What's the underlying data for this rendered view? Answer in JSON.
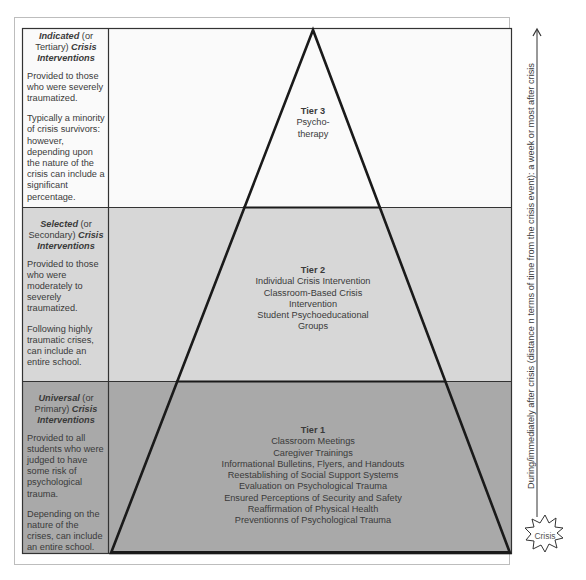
{
  "diagram": {
    "type": "tiered-pyramid",
    "colors": {
      "tier3_bg": "#fafafa",
      "tier2_bg": "#d7d7d7",
      "tier1_bg": "#a9a9a9",
      "line": "#1a1a1a"
    },
    "left_column": {
      "tier3": {
        "heading_bold": "Indicated",
        "heading_rest1": " (or Tertiary) ",
        "heading_bold2": "Crisis Interventions",
        "para1": "Provided to those who were severely traumatized.",
        "para2": "Typically a minority of crisis survivors: however, depending upon the nature of the crisis can include a significant percentage."
      },
      "tier2": {
        "heading_bold": "Selected",
        "heading_rest1": " (or Secondary) ",
        "heading_bold2": "Crisis Interventions",
        "para1": "Provided to those who were moderately to severely traumatized.",
        "para2": "Following highly traumatic crises, can include an entire school."
      },
      "tier1": {
        "heading_bold": "Universal",
        "heading_rest1": " (or Primary) ",
        "heading_bold2": "Crisis Interventions",
        "para1": "Provided to all students who were judged to have some risk of psychological trauma.",
        "para2": "Depending on the nature of the crises, can include an entire school."
      }
    },
    "pyramid": {
      "tier3": {
        "title": "Tier 3",
        "items": [
          "Psycho-",
          "therapy"
        ]
      },
      "tier2": {
        "title": "Tier 2",
        "items": [
          "Individual Crisis Intervention",
          "Classroom-Based Crisis",
          "Intervention",
          "Student Psychoeducational",
          "Groups"
        ]
      },
      "tier1": {
        "title": "Tier 1",
        "items": [
          "Classroom Meetings",
          "Caregiver Trainings",
          "Informational Bulletins, Flyers, and Handouts",
          "Reestablishing of Social Support Systems",
          "Evaluation on Psychological Trauma",
          "Ensured Perceptions of Security and Safety",
          "Reaffirmation of Physical Health",
          "Preventionns of Psychological Trauma"
        ]
      }
    },
    "time_axis": {
      "label": "During/immediately after crisis (distance  n terms of time from the crisis event): a week or most after crisis",
      "origin_label": "Crisis"
    }
  }
}
